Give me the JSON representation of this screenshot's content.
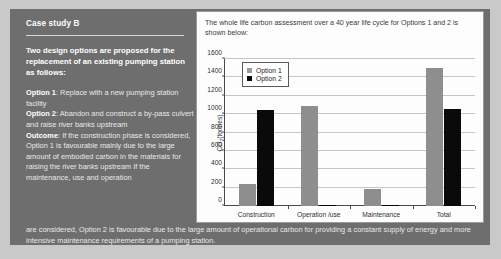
{
  "left_panel": {
    "case_title": "Case study B",
    "lead": "Two design options are proposed for the replacement of an existing pumping station as follows:",
    "option1_label": "Option 1",
    "option1_text": ": Replace with a new pumping station facility",
    "option2_label": "Option 2",
    "option2_text": ": Abandon and construct a by-pass culvert and raise river banks upstream",
    "outcome_label": "Outcome",
    "outcome_text": ": If the construction phase is considered, Option 1 is favourable mainly due to the large amount of embodied carbon in the materials for raising the river banks upstream If the maintenance, use and operation"
  },
  "bottom_paragraph": "are considered, Option 2 is favourable due to the large amount of operational carbon for providing a constant supply of energy and more intensive maintenance requirements of  a pumping station.",
  "chart_panel": {
    "caption": "The whole life carbon assessment over a 40 year life cycle for Options 1 and 2 is shown below:"
  },
  "chart_data": {
    "type": "bar",
    "title": "",
    "xlabel": "",
    "ylabel": "CO2(tonnes)",
    "ylabel_prefix": "CO",
    "ylabel_sub": "2",
    "ylabel_suffix": "(tonnes)",
    "categories": [
      "Construction",
      "Operation /use",
      "Maintenance",
      "Total"
    ],
    "series": [
      {
        "name": "Option 1",
        "color": "#8e8e8e",
        "values": [
          240,
          1085,
          185,
          1500
        ]
      },
      {
        "name": "Option 2",
        "color": "#0a0a0a",
        "values": [
          1050,
          0,
          10,
          1060
        ]
      }
    ],
    "ylim": [
      0,
      1600
    ],
    "yticks": [
      0,
      200,
      400,
      600,
      800,
      1000,
      1200,
      1400,
      1600
    ],
    "grid": true,
    "legend_position": "upper-left-inside"
  }
}
